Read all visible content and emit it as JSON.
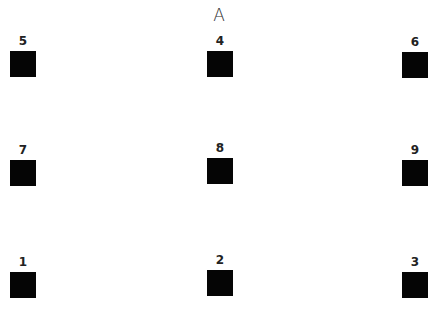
{
  "title": "A",
  "grid": [
    {
      "label": "5"
    },
    {
      "label": "4"
    },
    {
      "label": "6"
    },
    {
      "label": "7"
    },
    {
      "label": "8"
    },
    {
      "label": "9"
    },
    {
      "label": "1"
    },
    {
      "label": "2"
    },
    {
      "label": "3"
    }
  ],
  "colors": {
    "square": "#050505",
    "background": "#ffffff"
  }
}
